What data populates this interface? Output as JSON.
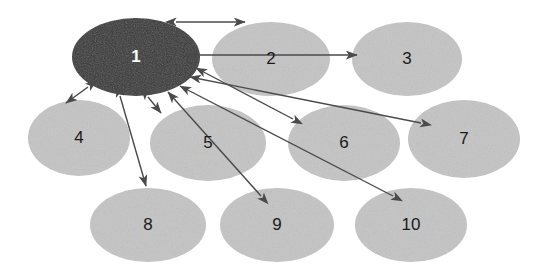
{
  "diagram": {
    "type": "node-link-graph",
    "title": "",
    "canvas": {
      "width": 547,
      "height": 274,
      "background": "#ffffff"
    },
    "colors": {
      "focus_node_fill": "#363636",
      "focus_node_text": "#ffffff",
      "node_fill": "#c8c8c8",
      "node_text": "#1a1a1a",
      "edge_stroke": "#4a4a4a"
    },
    "nodes": [
      {
        "id": "1",
        "label": "1",
        "cx": 136,
        "cy": 57,
        "rx": 64,
        "ry": 39,
        "highlighted": true,
        "fill": "#363636",
        "text_color": "#ffffff",
        "font_size": 17
      },
      {
        "id": "2",
        "label": "2",
        "cx": 271,
        "cy": 59,
        "rx": 59,
        "ry": 37,
        "highlighted": false,
        "fill": "#c8c8c8",
        "text_color": "#1a1a1a",
        "font_size": 17
      },
      {
        "id": "3",
        "label": "3",
        "cx": 407,
        "cy": 59,
        "rx": 55,
        "ry": 37,
        "highlighted": false,
        "fill": "#c8c8c8",
        "text_color": "#1a1a1a",
        "font_size": 17
      },
      {
        "id": "4",
        "label": "4",
        "cx": 79,
        "cy": 138,
        "rx": 51,
        "ry": 38,
        "highlighted": false,
        "fill": "#c8c8c8",
        "text_color": "#1a1a1a",
        "font_size": 17
      },
      {
        "id": "5",
        "label": "5",
        "cx": 208,
        "cy": 143,
        "rx": 58,
        "ry": 38,
        "highlighted": false,
        "fill": "#c8c8c8",
        "text_color": "#1a1a1a",
        "font_size": 17
      },
      {
        "id": "6",
        "label": "6",
        "cx": 344,
        "cy": 143,
        "rx": 56,
        "ry": 38,
        "highlighted": false,
        "fill": "#c8c8c8",
        "text_color": "#1a1a1a",
        "font_size": 17
      },
      {
        "id": "7",
        "label": "7",
        "cx": 464,
        "cy": 139,
        "rx": 56,
        "ry": 39,
        "highlighted": false,
        "fill": "#c8c8c8",
        "text_color": "#1a1a1a",
        "font_size": 17
      },
      {
        "id": "8",
        "label": "8",
        "cx": 148,
        "cy": 225,
        "rx": 58,
        "ry": 37,
        "highlighted": false,
        "fill": "#c8c8c8",
        "text_color": "#1a1a1a",
        "font_size": 17
      },
      {
        "id": "9",
        "label": "9",
        "cx": 277,
        "cy": 225,
        "rx": 57,
        "ry": 37,
        "highlighted": false,
        "fill": "#c8c8c8",
        "text_color": "#1a1a1a",
        "font_size": 17
      },
      {
        "id": "10",
        "label": "10",
        "cx": 411,
        "cy": 225,
        "rx": 56,
        "ry": 37,
        "highlighted": false,
        "fill": "#c8c8c8",
        "text_color": "#1a1a1a",
        "font_size": 17
      }
    ],
    "edges": [
      {
        "id": "e-1-2",
        "from": "1",
        "to": "2",
        "x1": 176,
        "y1": 22,
        "x2": 245,
        "y2": 22,
        "arrow_start": true,
        "arrow_end": true
      },
      {
        "id": "e-1-3",
        "from": "1",
        "to": "3",
        "x1": 196,
        "y1": 55,
        "x2": 357,
        "y2": 55,
        "arrow_start": true,
        "arrow_end": true
      },
      {
        "id": "e-6-1",
        "from": "6",
        "to": "1",
        "x1": 293,
        "y1": 119,
        "x2": 196,
        "y2": 68,
        "arrow_start": true,
        "arrow_end": true
      },
      {
        "id": "e-7-1",
        "from": "7",
        "to": "1",
        "x1": 421,
        "y1": 123,
        "x2": 190,
        "y2": 77,
        "arrow_start": true,
        "arrow_end": true
      },
      {
        "id": "e-10-1",
        "from": "10",
        "to": "1",
        "x1": 393,
        "y1": 196,
        "x2": 180,
        "y2": 86,
        "arrow_start": true,
        "arrow_end": true
      },
      {
        "id": "e-9-1",
        "from": "9",
        "to": "1",
        "x1": 261,
        "y1": 196,
        "x2": 168,
        "y2": 92,
        "arrow_start": true,
        "arrow_end": true
      },
      {
        "id": "e-1-4",
        "from": "1",
        "to": "4",
        "x1": 88,
        "y1": 87,
        "x2": 66,
        "y2": 103,
        "arrow_start": true,
        "arrow_end": true
      },
      {
        "id": "e-1-8",
        "from": "1",
        "to": "8",
        "x1": 120,
        "y1": 96,
        "x2": 146,
        "y2": 186,
        "arrow_start": true,
        "arrow_end": true
      },
      {
        "id": "e-1-5",
        "from": "1",
        "to": "5",
        "x1": 148,
        "y1": 97,
        "x2": 161,
        "y2": 113,
        "arrow_start": true,
        "arrow_end": true
      }
    ],
    "edge_list_readable": [
      "1 <-> 2",
      "1 <-> 3",
      "1 <-> 4",
      "1 <-> 5",
      "1 <-> 6",
      "1 <-> 7",
      "1 <-> 8",
      "1 <-> 9",
      "1 <-> 10"
    ]
  }
}
